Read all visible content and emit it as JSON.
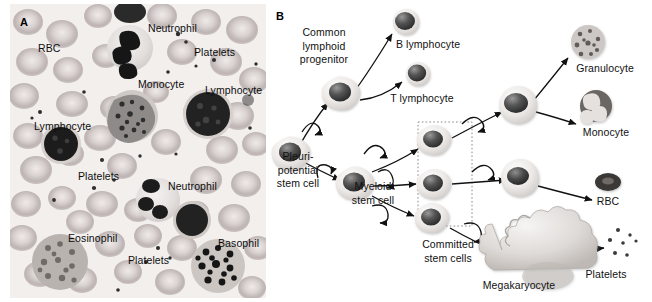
{
  "figure": {
    "panels": [
      {
        "letter": "A",
        "name": "blood-smear-micrograph",
        "labels": [
          {
            "text": "RBC",
            "x": 28,
            "y": 38
          },
          {
            "text": "Neutrophil",
            "x": 138,
            "y": 18
          },
          {
            "text": "Platelets",
            "x": 184,
            "y": 42
          },
          {
            "text": "Monocyte",
            "x": 128,
            "y": 74
          },
          {
            "text": "Lymphocyte",
            "x": 195,
            "y": 80
          },
          {
            "text": "Lymphocyte",
            "x": 24,
            "y": 116
          },
          {
            "text": "Platelets",
            "x": 68,
            "y": 166
          },
          {
            "text": "Neutrophil",
            "x": 158,
            "y": 176
          },
          {
            "text": "Eosinophil",
            "x": 58,
            "y": 228
          },
          {
            "text": "Platelets",
            "x": 118,
            "y": 250
          },
          {
            "text": "Basophil",
            "x": 208,
            "y": 233
          }
        ]
      },
      {
        "letter": "B",
        "name": "hematopoiesis-lineage-diagram",
        "labels": [
          {
            "id": "common-lymphoid-progenitor",
            "lines": [
              "Common",
              "lymphoid",
              "progenitor"
            ],
            "x": 22,
            "y": 26,
            "w": 72
          },
          {
            "id": "b-lymphocyte",
            "lines": [
              "B lymphocyte"
            ],
            "x": 123,
            "y": 38,
            "w": 78
          },
          {
            "id": "t-lymphocyte",
            "lines": [
              "T lymphocyte"
            ],
            "x": 117,
            "y": 92,
            "w": 78
          },
          {
            "id": "pleuripotential-stem-cell",
            "lines": [
              "Pleuri-",
              "potential",
              "stem cell"
            ],
            "x": 2,
            "y": 150,
            "w": 60
          },
          {
            "id": "myeloid-stem-cell",
            "lines": [
              "Myeloid",
              "stem cell"
            ],
            "x": 76,
            "y": 180,
            "w": 62
          },
          {
            "id": "committed-stem-cells",
            "lines": [
              "Committed",
              "stem cells"
            ],
            "x": 148,
            "y": 238,
            "w": 68
          },
          {
            "id": "granulocyte",
            "lines": [
              "Granulocyte"
            ],
            "x": 301,
            "y": 62,
            "w": 76
          },
          {
            "id": "monocyte",
            "lines": [
              "Monocyte"
            ],
            "x": 307,
            "y": 126,
            "w": 66
          },
          {
            "id": "rbc",
            "lines": [
              "RBC"
            ],
            "x": 324,
            "y": 195,
            "w": 36
          },
          {
            "id": "platelets",
            "lines": [
              "Platelets"
            ],
            "x": 310,
            "y": 268,
            "w": 60
          },
          {
            "id": "megakaryocyte",
            "lines": [
              "Megakaryocyte"
            ],
            "x": 208,
            "y": 279,
            "w": 90
          }
        ]
      }
    ],
    "colors": {
      "background": "#ffffff",
      "smear_background": "#efecea",
      "rbc_fill": "#cfc8c8",
      "nucleus_dark": "#3a3a3a",
      "cell_cytoplasm": "#e3e1df",
      "arrow": "#111111",
      "dotted_box": "#7a7a7a",
      "text": "#111111"
    }
  }
}
